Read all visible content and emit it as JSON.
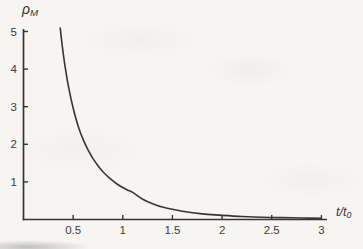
{
  "figure": {
    "y_axis_title": {
      "main": "ρ",
      "sub": "M"
    },
    "x_axis_title": {
      "main": "t/t",
      "sub": "0"
    }
  },
  "chart_data": {
    "type": "line",
    "title": "",
    "xlabel": "t/t0",
    "ylabel": "ρM",
    "xlim": [
      0,
      3.08
    ],
    "ylim": [
      0,
      5.1
    ],
    "grid": false,
    "legend_position": "none",
    "x_tick_values": [
      0.5,
      1,
      1.5,
      2,
      2.5,
      3
    ],
    "x_tick_labels": [
      "0.5",
      "1",
      "1.5",
      "2",
      "2.5",
      "3"
    ],
    "y_tick_values": [
      1,
      2,
      3,
      4,
      5
    ],
    "y_tick_labels": [
      "1",
      "2",
      "3",
      "4",
      "5"
    ],
    "series": [
      {
        "name": "rho-M-decay-curve",
        "x": [
          0.37,
          0.4,
          0.43,
          0.46,
          0.5,
          0.55,
          0.6,
          0.65,
          0.7,
          0.75,
          0.8,
          0.85,
          0.9,
          0.95,
          1.0,
          1.05,
          1.1,
          1.2,
          1.3,
          1.4,
          1.5,
          1.6,
          1.8,
          2.0,
          2.2,
          2.4,
          2.6,
          2.8,
          3.0
        ],
        "y": [
          5.09,
          4.42,
          3.88,
          3.44,
          2.96,
          2.49,
          2.13,
          1.85,
          1.62,
          1.43,
          1.27,
          1.14,
          1.03,
          0.93,
          0.85,
          0.78,
          0.72,
          0.54,
          0.42,
          0.33,
          0.27,
          0.22,
          0.15,
          0.11,
          0.08,
          0.06,
          0.05,
          0.04,
          0.03
        ]
      }
    ]
  },
  "colors": {
    "ink": "#36352f",
    "label": "#3d3c36",
    "paper": "#f6f5f2"
  }
}
